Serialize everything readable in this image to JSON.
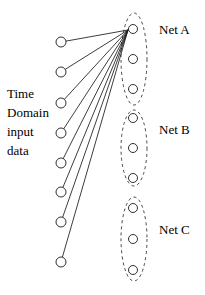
{
  "diagram": {
    "type": "node-link-diagram",
    "background_color": "#ffffff",
    "stroke_color": "#1a1a1a",
    "node_fill": "#ffffff",
    "group_outline_style": "dashed-ellipse"
  },
  "input_caption": {
    "line1": "Time",
    "line2": "Domain",
    "line3": "input",
    "line4": "data"
  },
  "input_nodes": [
    {
      "id": "in-1",
      "cx": 61,
      "cy": 42,
      "r": 5
    },
    {
      "id": "in-2",
      "cx": 61,
      "cy": 72,
      "r": 5
    },
    {
      "id": "in-3",
      "cx": 61,
      "cy": 103,
      "r": 5
    },
    {
      "id": "in-4",
      "cx": 61,
      "cy": 133,
      "r": 5
    },
    {
      "id": "in-5",
      "cx": 61,
      "cy": 163,
      "r": 5
    },
    {
      "id": "in-6",
      "cx": 61,
      "cy": 192,
      "r": 5
    },
    {
      "id": "in-7",
      "cx": 61,
      "cy": 222,
      "r": 5
    },
    {
      "id": "in-8",
      "cx": 61,
      "cy": 262,
      "r": 5
    }
  ],
  "convergence_point": {
    "x": 128,
    "y": 30
  },
  "edges": [
    {
      "from": "in-1",
      "to": "netA-node-1"
    },
    {
      "from": "in-2",
      "to": "netA-node-1"
    },
    {
      "from": "in-3",
      "to": "netA-node-1"
    },
    {
      "from": "in-4",
      "to": "netA-node-1"
    },
    {
      "from": "in-5",
      "to": "netA-node-1"
    },
    {
      "from": "in-6",
      "to": "netA-node-1"
    },
    {
      "from": "in-7",
      "to": "netA-node-1"
    },
    {
      "from": "in-8",
      "to": "netA-node-1"
    }
  ],
  "groups": [
    {
      "id": "net-a",
      "label": "Net A",
      "label_x": 159,
      "label_y": 22,
      "ellipse": {
        "cx": 134,
        "cy": 59,
        "rx": 13,
        "ry": 46
      },
      "nodes": [
        {
          "id": "netA-node-1",
          "cx": 133,
          "cy": 29,
          "r": 4.5
        },
        {
          "id": "netA-node-2",
          "cx": 133,
          "cy": 59,
          "r": 4.5
        },
        {
          "id": "netA-node-3",
          "cx": 133,
          "cy": 89,
          "r": 4.5
        }
      ]
    },
    {
      "id": "net-b",
      "label": "Net B",
      "label_x": 159,
      "label_y": 122,
      "ellipse": {
        "cx": 134,
        "cy": 148,
        "rx": 13,
        "ry": 38
      },
      "nodes": [
        {
          "id": "netB-node-1",
          "cx": 133,
          "cy": 118,
          "r": 4.5
        },
        {
          "id": "netB-node-2",
          "cx": 133,
          "cy": 148,
          "r": 4.5
        },
        {
          "id": "netB-node-3",
          "cx": 133,
          "cy": 178,
          "r": 4.5
        }
      ]
    },
    {
      "id": "net-c",
      "label": "Net C",
      "label_x": 159,
      "label_y": 222,
      "ellipse": {
        "cx": 134,
        "cy": 239,
        "rx": 13,
        "ry": 42
      },
      "nodes": [
        {
          "id": "netC-node-1",
          "cx": 133,
          "cy": 208,
          "r": 4.5
        },
        {
          "id": "netC-node-2",
          "cx": 133,
          "cy": 239,
          "r": 4.5
        },
        {
          "id": "netC-node-3",
          "cx": 133,
          "cy": 270,
          "r": 4.5
        }
      ]
    }
  ]
}
